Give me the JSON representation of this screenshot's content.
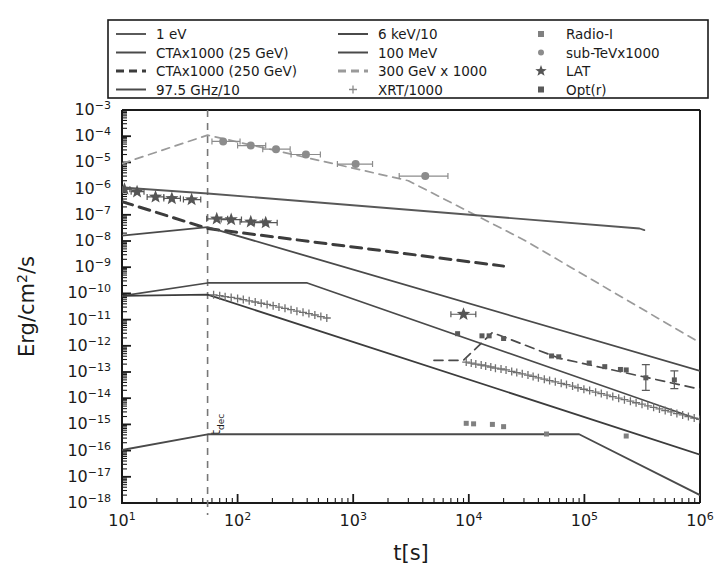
{
  "figure": {
    "background_color": "#ffffff",
    "width": 718,
    "height": 586
  },
  "axes": {
    "xlabel": "t[s]",
    "ylabel_prefix": "Erg/cm",
    "ylabel_sup": "2",
    "ylabel_suffix": "/s",
    "x_tick_labels": [
      "10",
      "10",
      "10",
      "10",
      "10",
      "10"
    ],
    "x_tick_exponents": [
      "1",
      "2",
      "3",
      "4",
      "5",
      "6"
    ],
    "y_tick_labels": [
      "10",
      "10",
      "10",
      "10",
      "10",
      "10",
      "10",
      "10",
      "10",
      "10",
      "10",
      "10",
      "10",
      "10",
      "10",
      "10"
    ],
    "y_tick_exponents": [
      "−3",
      "−4",
      "−5",
      "−6",
      "−7",
      "−8",
      "−9",
      "−10",
      "−11",
      "−12",
      "−13",
      "−14",
      "−15",
      "−16",
      "−17",
      "−18"
    ]
  },
  "annotations": {
    "tdec_label_main": "t",
    "tdec_label_sub": "dec",
    "tdec_x_value": 55
  },
  "legend": {
    "columns": [
      {
        "entries": [
          {
            "label": "1 eV",
            "style": "solid",
            "color": "#5a5a5a",
            "marker": "line"
          },
          {
            "label": "CTAx1000 (25 GeV)",
            "style": "solid",
            "color": "#4a4a4a",
            "marker": "line"
          },
          {
            "label": "CTAx1000 (250 GeV)",
            "style": "dashed",
            "color": "#3c3c3c",
            "marker": "line"
          },
          {
            "label": "97.5 GHz/10",
            "style": "solid",
            "color": "#4a4a4a",
            "marker": "line"
          }
        ]
      },
      {
        "entries": [
          {
            "label": "6 keV/10",
            "style": "solid",
            "color": "#4a4a4a",
            "marker": "line"
          },
          {
            "label": "100 MeV",
            "style": "solid",
            "color": "#4a4a4a",
            "marker": "line"
          },
          {
            "label": "300 GeV x 1000",
            "style": "dashed",
            "color": "#9a9a9a",
            "marker": "line"
          },
          {
            "label": "XRT/1000",
            "style": "marker",
            "color": "#8a8a8a",
            "marker": "plus"
          }
        ]
      },
      {
        "entries": [
          {
            "label": "Radio-I",
            "style": "marker",
            "color": "#808080",
            "marker": "square"
          },
          {
            "label": "sub-TeVx1000",
            "style": "marker",
            "color": "#8c8c8c",
            "marker": "circle"
          },
          {
            "label": "LAT",
            "style": "marker",
            "color": "#555555",
            "marker": "star"
          },
          {
            "label": "Opt(r)",
            "style": "marker",
            "color": "#5a5a5a",
            "marker": "square"
          }
        ]
      }
    ]
  },
  "chart_data": {
    "type": "line",
    "title": "",
    "xlabel": "t[s]",
    "ylabel": "Erg/cm2/s",
    "xscale": "log",
    "yscale": "log",
    "xlim": [
      10,
      1000000
    ],
    "ylim": [
      1e-18,
      0.001
    ],
    "grid": false,
    "legend_position": "top",
    "vertical_marker": {
      "name": "t_dec",
      "x": 55
    },
    "series": [
      {
        "name": "300 GeV x 1000",
        "type": "line",
        "style": "dashed",
        "color": "#9a9a9a",
        "width": 1.7,
        "points": [
          [
            10,
            9e-06
          ],
          [
            55,
            0.00011
          ],
          [
            3000,
            2e-06
          ],
          [
            30000,
            1.1e-08
          ],
          [
            1000000,
            1.3e-12
          ]
        ]
      },
      {
        "name": "1 eV",
        "type": "line",
        "style": "solid",
        "color": "#585858",
        "width": 1.8,
        "points": [
          [
            10,
            1.1e-06
          ],
          [
            55,
            6.5e-07
          ],
          [
            300000,
            3e-08
          ],
          [
            330000,
            2.6e-08
          ]
        ]
      },
      {
        "name": "CTAx1000 (250 GeV)",
        "type": "line",
        "style": "dashed",
        "color": "#3c3c3c",
        "width": 3.0,
        "points": [
          [
            10,
            3.2e-07
          ],
          [
            55,
            3e-08
          ],
          [
            20000,
            1.1e-09
          ]
        ]
      },
      {
        "name": "CTAx1000 (25 GeV)",
        "type": "line",
        "style": "solid",
        "color": "#4a4a4a",
        "width": 1.8,
        "points": [
          [
            10,
            1.6e-08
          ],
          [
            55,
            3.4e-08
          ],
          [
            1000000,
            1.1e-13
          ]
        ]
      },
      {
        "name": "100 MeV",
        "type": "line",
        "style": "solid",
        "color": "#4a4a4a",
        "width": 1.7,
        "points": [
          [
            10,
            8e-11
          ],
          [
            55,
            2.5e-10
          ],
          [
            400,
            2.5e-10
          ],
          [
            1000000,
            1.5e-15
          ]
        ]
      },
      {
        "name": "6 keV/10",
        "type": "line",
        "style": "solid",
        "color": "#3c3c3c",
        "width": 1.8,
        "points": [
          [
            10,
            8e-11
          ],
          [
            55,
            9e-11
          ],
          [
            1000000,
            7e-17
          ]
        ]
      },
      {
        "name": "97.5 GHz/10",
        "type": "line",
        "style": "solid",
        "color": "#4a4a4a",
        "width": 1.8,
        "points": [
          [
            10,
            1.05e-16
          ],
          [
            55,
            4.2e-16
          ],
          [
            90000,
            4.2e-16
          ],
          [
            1000000,
            2e-18
          ]
        ]
      }
    ],
    "scatter_series": [
      {
        "name": "sub-TeVx1000",
        "marker": "circle",
        "color": "#8c8c8c",
        "size": 8,
        "points": [
          {
            "x": 75,
            "y": 6.3e-05,
            "xerr_lo": 15,
            "xerr_hi": 30
          },
          {
            "x": 130,
            "y": 4.4e-05,
            "xerr_lo": 30,
            "xerr_hi": 45
          },
          {
            "x": 215,
            "y": 3.2e-05,
            "xerr_lo": 50,
            "xerr_hi": 70
          },
          {
            "x": 390,
            "y": 2e-05,
            "xerr_lo": 100,
            "xerr_hi": 130
          },
          {
            "x": 1050,
            "y": 8.6e-06,
            "xerr_lo": 320,
            "xerr_hi": 420
          },
          {
            "x": 4200,
            "y": 3e-06,
            "xerr_lo": 1700,
            "xerr_hi": 2400
          }
        ]
      },
      {
        "name": "LAT",
        "marker": "star",
        "color": "#555555",
        "size": 7,
        "points": [
          {
            "x": 10.5,
            "y": 9.5e-07,
            "xerr_lo": 0.8,
            "xerr_hi": 1.2
          },
          {
            "x": 13.5,
            "y": 7.6e-07,
            "xerr_lo": 1.5,
            "xerr_hi": 2.0
          },
          {
            "x": 19.5,
            "y": 4.8e-07,
            "xerr_lo": 3.0,
            "xerr_hi": 3.5
          },
          {
            "x": 27,
            "y": 4.2e-07,
            "xerr_lo": 4.0,
            "xerr_hi": 5.0
          },
          {
            "x": 40,
            "y": 3.8e-07,
            "xerr_lo": 6.0,
            "xerr_hi": 8.0
          },
          {
            "x": 66,
            "y": 7e-08,
            "xerr_lo": 12,
            "xerr_hi": 16
          },
          {
            "x": 88,
            "y": 6.6e-08,
            "xerr_lo": 16,
            "xerr_hi": 20
          },
          {
            "x": 130,
            "y": 5.4e-08,
            "xerr_lo": 25,
            "xerr_hi": 35
          },
          {
            "x": 175,
            "y": 5e-08,
            "xerr_lo": 35,
            "xerr_hi": 45
          },
          {
            "x": 9000,
            "y": 1.6e-11,
            "xerr_lo": 2000,
            "xerr_hi": 2500
          }
        ]
      },
      {
        "name": "XRT/1000",
        "marker": "plus",
        "color": "#707070",
        "size": 4,
        "points": [
          {
            "x": 62,
            "y": 8.8e-11
          },
          {
            "x": 70,
            "y": 8.2e-11
          },
          {
            "x": 78,
            "y": 7.5e-11
          },
          {
            "x": 88,
            "y": 7e-11
          },
          {
            "x": 100,
            "y": 6.4e-11
          },
          {
            "x": 112,
            "y": 5.8e-11
          },
          {
            "x": 126,
            "y": 5.2e-11
          },
          {
            "x": 142,
            "y": 4.7e-11
          },
          {
            "x": 160,
            "y": 4.2e-11
          },
          {
            "x": 180,
            "y": 3.8e-11
          },
          {
            "x": 203,
            "y": 3.4e-11
          },
          {
            "x": 228,
            "y": 3e-11
          },
          {
            "x": 257,
            "y": 2.7e-11
          },
          {
            "x": 290,
            "y": 2.4e-11
          },
          {
            "x": 326,
            "y": 2.1e-11
          },
          {
            "x": 368,
            "y": 1.9e-11
          },
          {
            "x": 414,
            "y": 1.7e-11
          },
          {
            "x": 466,
            "y": 1.5e-11
          },
          {
            "x": 525,
            "y": 1.3e-11
          },
          {
            "x": 591,
            "y": 1.15e-11
          },
          {
            "x": 9500,
            "y": 2.4e-13
          },
          {
            "x": 10500,
            "y": 2.2e-13
          },
          {
            "x": 11500,
            "y": 2e-13
          },
          {
            "x": 12800,
            "y": 1.85e-13
          },
          {
            "x": 14000,
            "y": 1.7e-13
          },
          {
            "x": 15500,
            "y": 1.55e-13
          },
          {
            "x": 17000,
            "y": 1.4e-13
          },
          {
            "x": 19000,
            "y": 1.3e-13
          },
          {
            "x": 21000,
            "y": 1.2e-13
          },
          {
            "x": 23500,
            "y": 1.05e-13
          },
          {
            "x": 26000,
            "y": 9.5e-14
          },
          {
            "x": 29000,
            "y": 8.5e-14
          },
          {
            "x": 32500,
            "y": 7.6e-14
          },
          {
            "x": 36000,
            "y": 6.8e-14
          },
          {
            "x": 40000,
            "y": 6e-14
          },
          {
            "x": 45000,
            "y": 5.3e-14
          },
          {
            "x": 50000,
            "y": 4.7e-14
          },
          {
            "x": 56000,
            "y": 4.2e-14
          },
          {
            "x": 63000,
            "y": 3.7e-14
          },
          {
            "x": 70000,
            "y": 3.3e-14
          },
          {
            "x": 79000,
            "y": 2.9e-14
          },
          {
            "x": 88000,
            "y": 2.5e-14
          },
          {
            "x": 99000,
            "y": 2.2e-14
          },
          {
            "x": 111000,
            "y": 1.95e-14
          },
          {
            "x": 125000,
            "y": 1.7e-14
          },
          {
            "x": 140000,
            "y": 1.5e-14
          },
          {
            "x": 157000,
            "y": 1.3e-14
          },
          {
            "x": 176000,
            "y": 1.15e-14
          },
          {
            "x": 198000,
            "y": 1e-14
          },
          {
            "x": 222000,
            "y": 8.8e-15
          },
          {
            "x": 250000,
            "y": 7.7e-15
          },
          {
            "x": 280000,
            "y": 6.7e-15
          },
          {
            "x": 315000,
            "y": 5.9e-15
          },
          {
            "x": 354000,
            "y": 5.1e-15
          },
          {
            "x": 397000,
            "y": 4.5e-15
          },
          {
            "x": 446000,
            "y": 3.9e-15
          },
          {
            "x": 500000,
            "y": 3.4e-15
          },
          {
            "x": 562000,
            "y": 3e-15
          },
          {
            "x": 631000,
            "y": 2.6e-15
          },
          {
            "x": 708000,
            "y": 2.3e-15
          },
          {
            "x": 794000,
            "y": 2e-15
          },
          {
            "x": 891000,
            "y": 1.75e-15
          },
          {
            "x": 1000000,
            "y": 1.55e-15
          }
        ]
      },
      {
        "name": "Opt(r)",
        "marker": "square",
        "color": "#5a5a5a",
        "size": 5,
        "points": [
          {
            "x": 8000,
            "y": 2.9e-12
          },
          {
            "x": 13000,
            "y": 2.4e-12
          },
          {
            "x": 15000,
            "y": 2.4e-12
          },
          {
            "x": 20000,
            "y": 1.9e-12
          },
          {
            "x": 52000,
            "y": 4.1e-13
          },
          {
            "x": 60000,
            "y": 3.8e-13
          },
          {
            "x": 110000,
            "y": 2.2e-13
          },
          {
            "x": 150000,
            "y": 1.6e-13
          },
          {
            "x": 205000,
            "y": 1.25e-13
          },
          {
            "x": 230000,
            "y": 1.2e-13
          },
          {
            "x": 340000,
            "y": 6e-14
          },
          {
            "x": 600000,
            "y": 5e-14
          }
        ]
      },
      {
        "name": "Radio-I",
        "marker": "square",
        "color": "#808080",
        "size": 5,
        "points": [
          {
            "x": 9500,
            "y": 1.1e-15
          },
          {
            "x": 11000,
            "y": 1.05e-15
          },
          {
            "x": 16000,
            "y": 1e-15
          },
          {
            "x": 20000,
            "y": 8.2e-16
          },
          {
            "x": 47000,
            "y": 4.3e-16
          },
          {
            "x": 230000,
            "y": 3.6e-16
          }
        ]
      }
    ],
    "data_guide_lines": [
      {
        "name": "opt-r-guide",
        "style": "dashed",
        "color": "#4a4a4a",
        "width": 1.7,
        "points": [
          [
            5000,
            2.8e-13
          ],
          [
            9000,
            2.8e-13
          ],
          [
            16000,
            3.2e-12
          ],
          [
            60000,
            3.4e-13
          ],
          [
            1000000,
            2.2e-14
          ]
        ]
      }
    ]
  }
}
